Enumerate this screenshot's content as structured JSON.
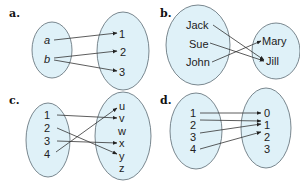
{
  "colors": {
    "set_fill": "#dff1f8",
    "set_stroke": "#5a6a72",
    "arrow": "#333333",
    "text": "#222222"
  },
  "panels": [
    {
      "label": "a.",
      "domain": [
        "a",
        "b"
      ],
      "codomain": [
        "1",
        "2",
        "3"
      ],
      "mappings": [
        [
          "a",
          "1"
        ],
        [
          "b",
          "2"
        ],
        [
          "b",
          "3"
        ]
      ]
    },
    {
      "label": "b.",
      "domain": [
        "Jack",
        "Sue",
        "John"
      ],
      "codomain": [
        "Mary",
        "Jill"
      ],
      "mappings": [
        [
          "Jack",
          "Jill"
        ],
        [
          "Sue",
          "Jill"
        ],
        [
          "John",
          "Mary"
        ]
      ]
    },
    {
      "label": "c.",
      "domain": [
        "1",
        "2",
        "3",
        "4"
      ],
      "codomain": [
        "u",
        "v",
        "w",
        "x",
        "y",
        "z"
      ],
      "mappings": [
        [
          "1",
          "v"
        ],
        [
          "2",
          "y"
        ],
        [
          "3",
          "x"
        ],
        [
          "4",
          "u"
        ]
      ]
    },
    {
      "label": "d.",
      "domain": [
        "1",
        "2",
        "3",
        "4"
      ],
      "codomain": [
        "0",
        "1",
        "2",
        "3"
      ],
      "mappings": [
        [
          "1",
          "0"
        ],
        [
          "2",
          "1"
        ],
        [
          "3",
          "1"
        ],
        [
          "4",
          "2"
        ]
      ]
    }
  ]
}
